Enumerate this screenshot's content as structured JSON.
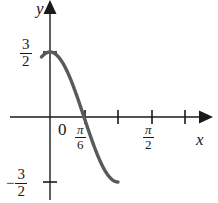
{
  "figure": {
    "background_color": "#ffffff",
    "curve_color": "#5a5a5a",
    "axis_color": "#1a1a1a",
    "width": 218,
    "height": 203
  },
  "axes": {
    "y_label": "y",
    "x_label": "x",
    "origin_label": "0"
  },
  "y_ticks": {
    "positive": {
      "minus": "",
      "numerator": "3",
      "denominator": "2"
    },
    "negative": {
      "minus": "−",
      "numerator": "3",
      "denominator": "2"
    }
  },
  "x_ticks": {
    "pi_over_6": {
      "numerator": "π",
      "denominator": "6"
    },
    "pi_over_2": {
      "numerator": "π",
      "denominator": "2"
    }
  },
  "chart_data": {
    "type": "line",
    "title": "",
    "xlabel": "x",
    "ylabel": "y",
    "expression": "y = (3/2)cos(3x)",
    "amplitude": 1.5,
    "period": 2.0943951,
    "xlim": [
      -0.1308997,
      1.0471976
    ],
    "ylim": [
      -1.75,
      1.9
    ],
    "grid": false,
    "legend": null,
    "x_tick_values": [
      0,
      0.5235988,
      1.0471976,
      1.5707963,
      2.0943951
    ],
    "x_tick_labels": [
      "0",
      "π/6",
      "",
      "π/2",
      ""
    ],
    "y_tick_values": [
      1.5,
      -1.5
    ],
    "y_tick_labels": [
      "3/2",
      "−3/2"
    ],
    "x": [
      0,
      0.0872665,
      0.1745329,
      0.2617994,
      0.3490659,
      0.4363323,
      0.5235988,
      0.6108652,
      0.6981317,
      0.7853982,
      0.8726646,
      0.9599311,
      1.0471976,
      1.134464,
      1.2217305,
      1.3089969,
      1.3962634,
      1.4835299,
      1.5707963,
      1.6580628,
      1.7453293,
      1.8325957,
      1.9198622,
      2.0071286,
      2.0943951
    ],
    "y": [
      1.5,
      1.4488887,
      1.2990381,
      1.0606602,
      0.75,
      0.3882286,
      0.0,
      -0.3882286,
      -0.75,
      -1.0606602,
      -1.2990381,
      -1.4488887,
      -1.5,
      -1.4488887,
      -1.2990381,
      -1.0606602,
      -0.75,
      -0.3882286,
      0.0,
      0.3882286,
      0.75,
      1.0606602,
      1.2990381,
      1.4488887,
      1.5
    ]
  }
}
